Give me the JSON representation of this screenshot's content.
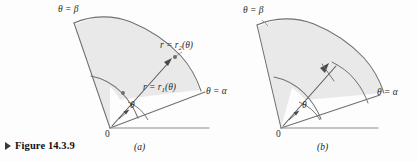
{
  "figure": {
    "caption": "Figure 14.3.9",
    "caption_marker": "triangle-right-icon",
    "background_color": "#fdfdfd",
    "line_color": "#6f6f6f",
    "fill_color": "#e8e8e8",
    "text_color": "#2a2a2a",
    "width": 418,
    "height": 162
  },
  "panels": [
    {
      "tag": "(a)",
      "labels": {
        "theta_beta": "θ = β",
        "theta_alpha": "θ = α",
        "r_outer": "r = r",
        "r_outer_sub": "2",
        "r_outer_arg": "(θ)",
        "r_inner": "r = r",
        "r_inner_sub": "1",
        "r_inner_arg": "(θ)",
        "theta_angle": "θ",
        "origin": "0"
      }
    },
    {
      "tag": "(b)",
      "labels": {
        "theta_beta": "θ = β",
        "theta_alpha": "θ = α",
        "theta_angle": "θ",
        "origin": "0"
      }
    }
  ]
}
